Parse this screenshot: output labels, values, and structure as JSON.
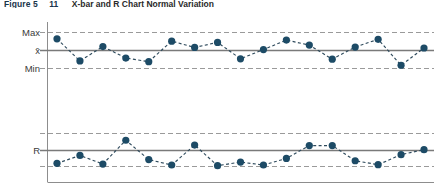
{
  "caption": {
    "label": "Figure 5",
    "number": "11",
    "title": "X-bar and R Chart Normal Variation"
  },
  "colors": {
    "marker": "#1d4b66",
    "connector": "#2e4a5c",
    "center_line": "#7a7a7a",
    "limit_line": "#9a9a9a",
    "frame": "#8d8d8d",
    "caption_accent": "#18344a",
    "background": "#ffffff"
  },
  "axis_labels": {
    "xbar_max": "Max",
    "xbar_center": "x̄",
    "xbar_min": "Min",
    "r_center": "R"
  },
  "chart_data": {
    "type": "line",
    "title": "X-bar and R Chart Normal Variation",
    "xlabel": "",
    "ylabel": "",
    "grid": false,
    "legend": "none",
    "panels": [
      {
        "name": "xbar-chart",
        "ylabel": "x̄",
        "upper_limit_label": "Max",
        "center_label": "x̄",
        "lower_limit_label": "Min",
        "upper_limit": 1.0,
        "center": 0.0,
        "lower_limit": -1.0,
        "ylim": [
          -1.45,
          1.45
        ],
        "x": [
          1,
          2,
          3,
          4,
          5,
          6,
          7,
          8,
          9,
          10,
          11,
          12,
          13,
          14,
          15,
          16,
          17
        ],
        "values": [
          0.65,
          -0.58,
          0.22,
          -0.42,
          -0.62,
          0.52,
          0.17,
          0.45,
          -0.46,
          0.05,
          0.58,
          0.3,
          -0.48,
          0.19,
          0.62,
          -0.82,
          0.14
        ]
      },
      {
        "name": "r-chart",
        "ylabel": "R",
        "upper_limit_label": "",
        "center_label": "R",
        "lower_limit_label": "",
        "upper_limit": 1.0,
        "center": 0.0,
        "lower_limit": -1.0,
        "ylim": [
          -1.45,
          1.45
        ],
        "x": [
          1,
          2,
          3,
          4,
          5,
          6,
          7,
          8,
          9,
          10,
          11,
          12,
          13,
          14,
          15,
          16,
          17
        ],
        "values": [
          -0.78,
          -0.3,
          -0.82,
          0.62,
          -0.55,
          -0.88,
          0.33,
          -0.92,
          -0.7,
          -0.88,
          -0.48,
          0.3,
          0.3,
          -0.62,
          -0.86,
          -0.25,
          0.05
        ]
      }
    ]
  }
}
